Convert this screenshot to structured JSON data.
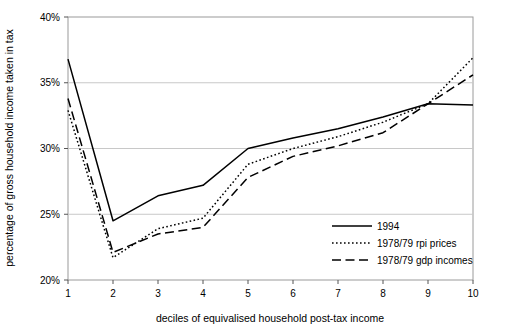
{
  "chart_data": {
    "type": "line",
    "title": "",
    "xlabel": "deciles of equivalised household post-tax income",
    "ylabel": "percentage of gross household income taken in tax",
    "categories": [
      "1",
      "2",
      "3",
      "4",
      "5",
      "6",
      "7",
      "8",
      "9",
      "10"
    ],
    "x": [
      1,
      2,
      3,
      4,
      5,
      6,
      7,
      8,
      9,
      10
    ],
    "xlim": [
      1,
      10
    ],
    "ylim": [
      20,
      40
    ],
    "ytick_labels": [
      "20%",
      "25%",
      "30%",
      "35%",
      "40%"
    ],
    "ytick_values": [
      20,
      25,
      30,
      35,
      40
    ],
    "xtick_labels": [
      "1",
      "2",
      "3",
      "4",
      "5",
      "6",
      "7",
      "8",
      "9",
      "10"
    ],
    "grid": "horizontal",
    "legend_position": "bottom-right",
    "series": [
      {
        "name": "1994",
        "style": "solid",
        "values": [
          36.8,
          24.5,
          26.4,
          27.2,
          30.0,
          30.8,
          31.5,
          32.4,
          33.4,
          33.3
        ]
      },
      {
        "name": "1978/79 rpi prices",
        "style": "dotted",
        "values": [
          32.9,
          21.7,
          23.9,
          24.7,
          28.8,
          30.0,
          30.9,
          32.0,
          33.4,
          36.9
        ]
      },
      {
        "name": "1978/79 gdp incomes",
        "style": "dashed",
        "values": [
          33.8,
          22.1,
          23.5,
          24.0,
          27.8,
          29.4,
          30.2,
          31.2,
          33.4,
          35.6
        ]
      }
    ]
  },
  "legend": {
    "items": [
      {
        "label": "1994",
        "style": "solid"
      },
      {
        "label": "1978/79 rpi prices",
        "style": "dotted"
      },
      {
        "label": "1978/79 gdp incomes",
        "style": "dashed"
      }
    ]
  },
  "colors": {
    "line": "#000000",
    "grid": "#c8c8c8",
    "axis": "#808080",
    "background": "#ffffff"
  }
}
